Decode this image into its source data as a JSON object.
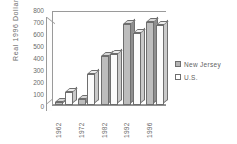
{
  "chart_data": {
    "type": "bar",
    "title": "",
    "xlabel": "",
    "ylabel": "Real  1996  Dollars",
    "categories": [
      "1962",
      "1972",
      "1982",
      "1992",
      "1996"
    ],
    "series": [
      {
        "name": "New Jersey",
        "values": [
          25,
          50,
          420,
          690,
          710
        ],
        "color": "#bdbdbd"
      },
      {
        "name": "U.S.",
        "values": [
          110,
          265,
          430,
          610,
          680
        ],
        "color": "#fbfbfb"
      }
    ],
    "ylim": [
      0,
      800
    ],
    "yticks": [
      "800",
      "700",
      "600",
      "500",
      "400",
      "300",
      "200",
      "100",
      "0"
    ],
    "grid": false,
    "legend_position": "right",
    "style": "3d-bar-grayscale"
  },
  "legend": {
    "items": [
      {
        "label": "New Jersey",
        "swatch": "nj"
      },
      {
        "label": "U.S.",
        "swatch": "us"
      }
    ]
  }
}
